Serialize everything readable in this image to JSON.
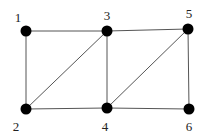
{
  "diagram": {
    "type": "undirected-graph",
    "node_color": "#000000",
    "edge_color": "#555555",
    "nodes": [
      {
        "id": "1",
        "label": "1",
        "x": 26,
        "y": 31,
        "lx": 18,
        "ly": 22
      },
      {
        "id": "2",
        "label": "2",
        "x": 26,
        "y": 109,
        "lx": 16,
        "ly": 131
      },
      {
        "id": "3",
        "label": "3",
        "x": 107,
        "y": 31,
        "lx": 107,
        "ly": 20
      },
      {
        "id": "4",
        "label": "4",
        "x": 107,
        "y": 108,
        "lx": 105,
        "ly": 131
      },
      {
        "id": "5",
        "label": "5",
        "x": 188,
        "y": 29,
        "lx": 189,
        "ly": 18
      },
      {
        "id": "6",
        "label": "6",
        "x": 189,
        "y": 109,
        "lx": 189,
        "ly": 131
      }
    ],
    "edges": [
      [
        "1",
        "3"
      ],
      [
        "1",
        "2"
      ],
      [
        "2",
        "3"
      ],
      [
        "2",
        "4"
      ],
      [
        "3",
        "4"
      ],
      [
        "3",
        "5"
      ],
      [
        "4",
        "5"
      ],
      [
        "4",
        "6"
      ],
      [
        "5",
        "6"
      ]
    ]
  }
}
